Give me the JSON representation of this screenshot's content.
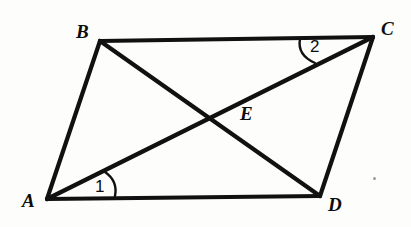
{
  "figure": {
    "kind": "parallelogram-with-diagonals",
    "background_color": "#fdfdfb",
    "stroke_color": "#111111",
    "stroke_width": 4.2,
    "arc_stroke_width": 2.4,
    "vertices": [
      {
        "id": "A",
        "label": "A",
        "x": 47,
        "y": 199,
        "label_x": 22,
        "label_y": 191
      },
      {
        "id": "B",
        "label": "B",
        "x": 100,
        "y": 41,
        "label_x": 76,
        "label_y": 22
      },
      {
        "id": "C",
        "label": "C",
        "x": 373,
        "y": 37,
        "label_x": 381,
        "label_y": 19
      },
      {
        "id": "D",
        "label": "D",
        "x": 320,
        "y": 196,
        "label_x": 328,
        "label_y": 195
      },
      {
        "id": "E",
        "label": "E",
        "x": 207,
        "y": 118,
        "label_x": 240,
        "label_y": 104
      }
    ],
    "sides": [
      {
        "id": "AB",
        "from": "A",
        "to": "B"
      },
      {
        "id": "BC",
        "from": "B",
        "to": "C"
      },
      {
        "id": "CD",
        "from": "C",
        "to": "D"
      },
      {
        "id": "DA",
        "from": "D",
        "to": "A"
      }
    ],
    "diagonals": [
      {
        "id": "AC",
        "from": "A",
        "to": "C"
      },
      {
        "id": "BD",
        "from": "B",
        "to": "D"
      }
    ],
    "intersection": {
      "id": "E",
      "label": "E",
      "of": [
        "AC",
        "BD"
      ]
    },
    "angles": [
      {
        "id": "angle-1",
        "label": "1",
        "at_vertex": "A",
        "between": [
          "AC",
          "AD"
        ],
        "label_x": 95,
        "label_y": 178,
        "arc_path": "M 105 172 Q 117 180 115 196",
        "arc_radius": 62
      },
      {
        "id": "angle-2",
        "label": "2",
        "at_vertex": "C",
        "between": [
          "CB",
          "CA"
        ],
        "label_x": 310,
        "label_y": 38,
        "arc_path": "M 300 39 Q 298 54 314 62",
        "arc_radius": 75
      }
    ],
    "artifacts": [
      {
        "id": "scan-speck",
        "x": 373,
        "y": 177
      }
    ]
  }
}
